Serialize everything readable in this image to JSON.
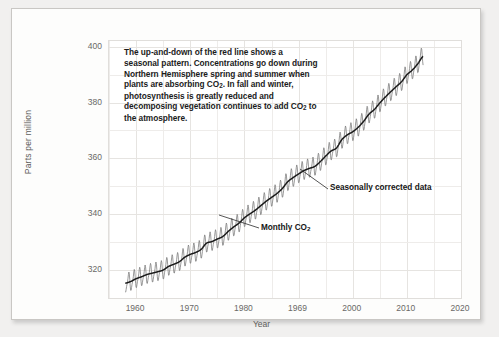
{
  "chart_data": {
    "type": "line",
    "title": "",
    "xlabel": "Year",
    "ylabel": "Parts per million",
    "xlim": [
      1955,
      2020
    ],
    "ylim": [
      310,
      402
    ],
    "grid": true,
    "legend_position": "none",
    "x_ticks": [
      "1960",
      "1970",
      "1980",
      "1969",
      "2000",
      "2010",
      "2020"
    ],
    "x_tick_values": [
      1960,
      1970,
      1980,
      1990,
      2000,
      2010,
      2020
    ],
    "y_ticks": [
      "320",
      "340",
      "360",
      "380",
      "400"
    ],
    "y_tick_values": [
      320,
      340,
      360,
      380,
      400
    ],
    "x_minor_step": 5,
    "y_minor_step": 10,
    "annotations": [
      {
        "name": "description",
        "text": "The up-and-down of the red line shows a seasonal pattern. Concentrations go down during Northern Hemisphere spring and summer when plants are absorbing CO2. In fall and winter, photosynthesis is greatly reduced and decomposing vegetation continues to add CO2 to the atmosphere."
      },
      {
        "name": "seasonally-corrected",
        "text": "Seasonally corrected data"
      },
      {
        "name": "monthly",
        "text": "Monthly CO"
      }
    ],
    "series": [
      {
        "name": "Monthly CO2",
        "style": "sawtooth",
        "color": "#7d7d7d",
        "seasonal_amplitude": 3.1,
        "x": [
          1958,
          1959,
          1960,
          1961,
          1962,
          1963,
          1964,
          1965,
          1966,
          1967,
          1968,
          1969,
          1970,
          1971,
          1972,
          1973,
          1974,
          1975,
          1976,
          1977,
          1978,
          1979,
          1980,
          1981,
          1982,
          1983,
          1984,
          1985,
          1986,
          1987,
          1988,
          1989,
          1990,
          1991,
          1992,
          1993,
          1994,
          1995,
          1996,
          1997,
          1998,
          1999,
          2000,
          2001,
          2002,
          2003,
          2004,
          2005,
          2006,
          2007,
          2008,
          2009,
          2010,
          2011,
          2012,
          2013
        ],
        "values": [
          315.3,
          315.9,
          316.9,
          317.6,
          318.4,
          318.9,
          319.4,
          320.0,
          321.3,
          322.1,
          323.0,
          324.6,
          325.6,
          326.3,
          327.4,
          329.6,
          330.2,
          331.1,
          332.0,
          333.8,
          335.4,
          336.8,
          338.7,
          340.1,
          341.4,
          343.0,
          344.6,
          346.0,
          347.4,
          349.2,
          351.6,
          353.1,
          354.4,
          355.6,
          356.4,
          357.1,
          358.8,
          360.8,
          362.6,
          363.7,
          366.7,
          368.4,
          369.5,
          371.1,
          373.2,
          375.8,
          377.5,
          379.8,
          381.9,
          383.8,
          385.6,
          387.4,
          389.9,
          391.6,
          393.8,
          396.5
        ]
      },
      {
        "name": "Seasonally corrected data",
        "style": "smooth-trend",
        "color": "#1a1a1a"
      }
    ]
  },
  "axes": {
    "y_title": "Parts per million",
    "x_title": "Year"
  },
  "annotation": {
    "line1": "The up-and-down of the red line shows a",
    "line2": "seasonal pattern. Concentrations go down",
    "line3": "during Northern Hemisphere spring and",
    "line4_a": "summer when plants are absorbing CO",
    "line4_sub": "2",
    "line4_b": ".",
    "line5": "In fall and winter, photosynthesis is",
    "line6": "greatly reduced and decomposing",
    "line7_a": "vegetation continues to add CO",
    "line7_sub": "2",
    "line7_b": " to the",
    "line8": "atmosphere."
  },
  "callouts": {
    "seasonal": "Seasonally corrected data",
    "monthly_text": "Monthly CO",
    "monthly_sub": "2"
  },
  "colors": {
    "page_background": "#f1f0ef",
    "card_background": "#fdfdfc",
    "plot_background": "#ffffff",
    "grid": "#eeecea",
    "monthly_line": "#7d7d7d",
    "trend_line": "#1a1a1a",
    "tick_text": "#6a6967",
    "axis_title": "#5d5c5a"
  }
}
